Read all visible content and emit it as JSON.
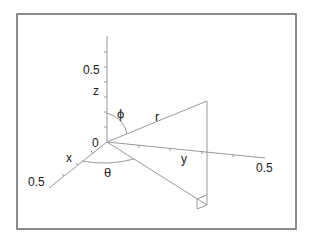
{
  "diagram": {
    "axes": {
      "z": {
        "label": "z",
        "tick_label": "0.5"
      },
      "x": {
        "label": "x",
        "tick_label": "0.5"
      },
      "y": {
        "label": "y",
        "tick_label": "0.5"
      },
      "origin_label": "0"
    },
    "labels": {
      "phi": "ϕ",
      "theta": "θ",
      "r": "r"
    },
    "colors": {
      "line": "#9a9a9a",
      "frame": "#555555",
      "text": "#222222"
    }
  }
}
